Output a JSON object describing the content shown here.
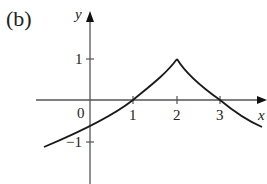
{
  "panel_label": "(b)",
  "axes": {
    "x_label": "x",
    "y_label": "y",
    "origin_label": "0",
    "x_ticks": [
      "1",
      "2",
      "3"
    ],
    "y_ticks": [
      "1",
      "−1"
    ]
  },
  "curve": {
    "description": "Continuous function with a cusp (sharp peak) at x=2, y=1; crosses x-axis at x=1 and x=3",
    "points": [
      [
        -1.1,
        -0.85
      ],
      [
        0,
        -0.45
      ],
      [
        1,
        0
      ],
      [
        2,
        1
      ],
      [
        3,
        0
      ],
      [
        3.7,
        -0.55
      ]
    ],
    "cusp": [
      2,
      1
    ],
    "color": "#1a1a1a"
  },
  "colors": {
    "axis": "#555555",
    "curve": "#1a1a1a",
    "background": "#ffffff"
  }
}
